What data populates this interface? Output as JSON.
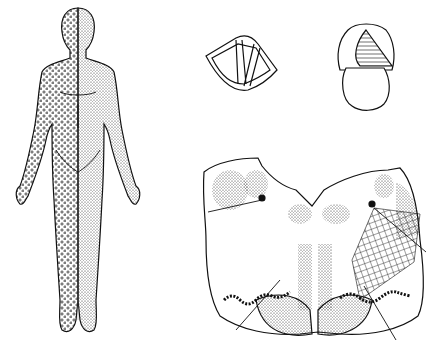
{
  "figure": {
    "colors": {
      "ink": "#111111",
      "background": "#ffffff"
    },
    "panels": [
      {
        "id": "body",
        "label": ""
      },
      {
        "id": "larynx-left",
        "label": ""
      },
      {
        "id": "larynx-right",
        "label": ""
      },
      {
        "id": "brainstem-section",
        "label": ""
      }
    ]
  }
}
